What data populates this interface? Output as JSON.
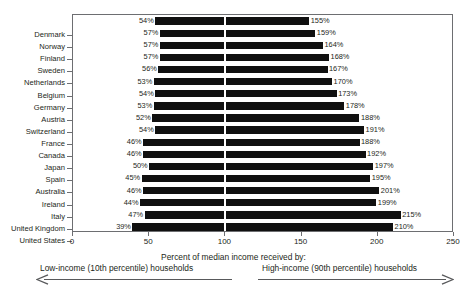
{
  "chart_data": {
    "type": "bar",
    "orientation": "horizontal",
    "title": "",
    "xlabel": "Percent of median income received by:",
    "ylabel": "",
    "xlim": [
      0,
      250
    ],
    "xticks": [
      0,
      50,
      100,
      150,
      200,
      250
    ],
    "grid": false,
    "reference_line": 100,
    "value_suffix": "%",
    "legend_position": "below-axis",
    "categories": [
      "Denmark",
      "Norway",
      "Finland",
      "Sweden",
      "Netherlands",
      "Belgium",
      "Germany",
      "Austria",
      "Switzerland",
      "France",
      "Canada",
      "Japan",
      "Spain",
      "Australia",
      "Ireland",
      "Italy",
      "United Kingdom",
      "United States"
    ],
    "series": [
      {
        "name": "Low-income (10th percentile) households",
        "values": [
          54,
          57,
          57,
          57,
          56,
          53,
          54,
          53,
          52,
          54,
          46,
          46,
          50,
          45,
          46,
          44,
          47,
          39
        ]
      },
      {
        "name": "High-income (90th percentile) households",
        "values": [
          155,
          159,
          164,
          168,
          167,
          170,
          173,
          178,
          188,
          191,
          188,
          192,
          197,
          195,
          201,
          199,
          215,
          210
        ]
      }
    ],
    "low_labels": [
      "54%",
      "57%",
      "57%",
      "57%",
      "56%",
      "53%",
      "54%",
      "53%",
      "52%",
      "54%",
      "46%",
      "46%",
      "50%",
      "45%",
      "46%",
      "44%",
      "47%",
      "39%"
    ],
    "high_labels": [
      "155%",
      "159%",
      "164%",
      "168%",
      "167%",
      "170%",
      "173%",
      "178%",
      "188%",
      "191%",
      "188%",
      "192%",
      "197%",
      "195%",
      "201%",
      "199%",
      "215%",
      "210%"
    ],
    "xtick_labels": [
      "0",
      "50",
      "100",
      "150",
      "200",
      "250"
    ]
  },
  "caption": {
    "title": "Percent of median income received by:",
    "low": "Low-income (10th percentile)  households",
    "high": "High-income (90th percentile) households",
    "arrow_left": "left-arrow-icon",
    "arrow_right": "right-arrow-icon"
  },
  "colors": {
    "bar": "#101010",
    "frame": "#6d6e71",
    "text": "#231f20",
    "background": "#ffffff",
    "gridline": "#ffffff"
  }
}
